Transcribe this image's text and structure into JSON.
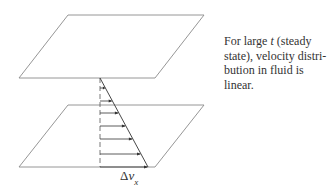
{
  "diagram": {
    "plates": {
      "top": {
        "points": [
          [
            68,
            15
          ],
          [
            204,
            15
          ],
          [
            155,
            78
          ],
          [
            19,
            78
          ]
        ]
      },
      "bottom": {
        "points": [
          [
            68,
            105
          ],
          [
            204,
            105
          ],
          [
            155,
            167
          ],
          [
            19,
            167
          ]
        ]
      }
    },
    "profile": {
      "axis_x": 100,
      "y_top": 78,
      "y_bottom": 167,
      "x_bottom": 148,
      "arrow_rows_y": [
        88,
        101,
        113,
        126,
        139,
        154,
        167
      ]
    },
    "colors": {
      "plate_stroke": "#8a8a8a",
      "profile_stroke": "#333333",
      "arrow": "#333333"
    },
    "bottom_label": {
      "delta": "Δ",
      "v": "v",
      "sub": "x"
    }
  },
  "caption": {
    "lines": [
      {
        "before": "For large ",
        "italic": "t",
        "after": " (steady"
      },
      {
        "text": "state), velocity distri-"
      },
      {
        "text": "bution in fluid is"
      },
      {
        "text": "linear."
      }
    ]
  }
}
